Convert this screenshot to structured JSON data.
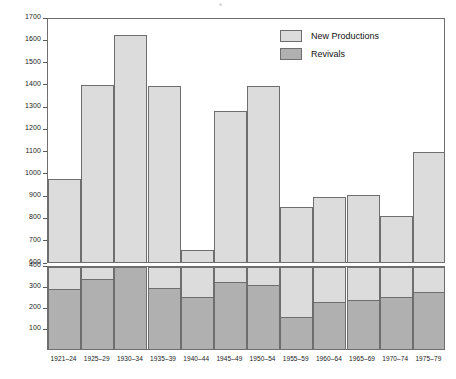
{
  "chart_data": {
    "type": "bar",
    "title": "",
    "subtitle": "",
    "xlabel": "",
    "ylabel": "",
    "grid": false,
    "legend_position": "upper-right",
    "broken_axis": true,
    "categories": [
      "1921–24",
      "1925–29",
      "1930–34",
      "1935–39",
      "1940–44",
      "1945–49",
      "1950–54",
      "1955–59",
      "1960–64",
      "1965–69",
      "1970–74",
      "1975–79"
    ],
    "series": [
      {
        "name": "New Productions",
        "color": "#dcdcdc",
        "values": [
          975,
          1400,
          1628,
          1398,
          655,
          1285,
          1397,
          850,
          895,
          905,
          810,
          1100
        ]
      },
      {
        "name": "Revivals",
        "color": "#b0b0b0",
        "values": [
          295,
          340,
          405,
          298,
          255,
          325,
          312,
          157,
          228,
          237,
          253,
          277
        ]
      }
    ],
    "upper_panel": {
      "ylim": [
        600,
        1700
      ],
      "yticks": [
        600,
        700,
        800,
        900,
        1000,
        1100,
        1200,
        1300,
        1400,
        1500,
        1600,
        1700
      ],
      "ytick_labels": [
        "600",
        "700",
        "800",
        "900",
        "1000",
        "1100",
        "1200",
        "1300",
        "1400",
        "1500",
        "1600",
        "1700"
      ],
      "series_shown": "New Productions"
    },
    "lower_panel": {
      "ylim": [
        0,
        400
      ],
      "yticks": [
        100,
        200,
        300,
        400
      ],
      "ytick_labels": [
        "100",
        "200",
        "300",
        "400"
      ],
      "series_shown": "Revivals (overlaid on New Productions)"
    }
  },
  "legend": {
    "items": [
      {
        "label": "New Productions",
        "color": "#dcdcdc"
      },
      {
        "label": "Revivals",
        "color": "#b0b0b0"
      }
    ]
  },
  "colors": {
    "new_productions": "#dcdcdc",
    "revivals": "#b0b0b0",
    "outline": "#6e6e6e",
    "text": "#1a1a1a",
    "background": "#ffffff"
  }
}
